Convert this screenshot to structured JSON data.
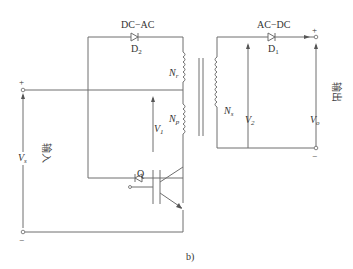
{
  "diagram": {
    "panel_label": "b)",
    "converter_labels": {
      "dc_ac": "DC−AC",
      "ac_dc": "AC−DC"
    },
    "diodes": {
      "d2": {
        "name": "D",
        "sub": "2"
      },
      "d1": {
        "name": "D",
        "sub": "1"
      }
    },
    "windings": {
      "nr": {
        "name": "N",
        "sub": "r"
      },
      "np": {
        "name": "N",
        "sub": "p"
      },
      "ns": {
        "name": "N",
        "sub": "s"
      }
    },
    "voltages": {
      "v1": {
        "name": "V",
        "sub": "1"
      },
      "v2": {
        "name": "V",
        "sub": "2"
      },
      "vs": {
        "name": "V",
        "sub": "s"
      },
      "vo": {
        "name": "V",
        "sub": "o"
      }
    },
    "switch": {
      "name": "Q"
    },
    "terminals": {
      "input_label": "输入",
      "output_label": "输出",
      "plus": "+",
      "minus": "−"
    },
    "colors": {
      "wire": "#6e6e6e",
      "text": "#333333"
    }
  }
}
